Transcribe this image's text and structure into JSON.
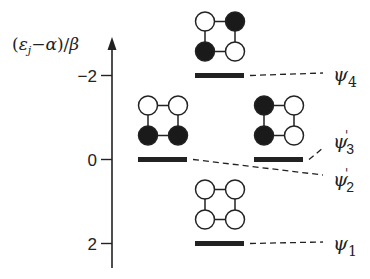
{
  "diagram": {
    "type": "huckel-mo-energy-diagram",
    "axis": {
      "label_parts": {
        "open": "(",
        "epsilon": "ε",
        "subscript": "j",
        "minus": "−",
        "alpha": "α",
        "close": ")/",
        "beta": "β"
      },
      "ticks": [
        {
          "value": -2,
          "label": "−2"
        },
        {
          "value": 0,
          "label": "0"
        },
        {
          "value": 2,
          "label": "2"
        }
      ],
      "range": [
        3,
        -3
      ]
    },
    "levels": [
      {
        "id": "psi4",
        "energy": -2,
        "column": "center",
        "label_base": "ψ",
        "label_sub": "4",
        "label_prime": "",
        "atoms_filled": {
          "tl": false,
          "tr": true,
          "bl": true,
          "br": false
        }
      },
      {
        "id": "psi2p",
        "energy": 0,
        "column": "left",
        "label_base": "ψ",
        "label_sub": "2",
        "label_prime": "'",
        "atoms_filled": {
          "tl": false,
          "tr": false,
          "bl": true,
          "br": true
        }
      },
      {
        "id": "psi3p",
        "energy": 0,
        "column": "right",
        "label_base": "ψ",
        "label_sub": "3",
        "label_prime": "'",
        "atoms_filled": {
          "tl": true,
          "tr": false,
          "bl": true,
          "br": false
        }
      },
      {
        "id": "psi1",
        "energy": 2,
        "column": "center",
        "label_base": "ψ",
        "label_sub": "1",
        "label_prime": "",
        "atoms_filled": {
          "tl": false,
          "tr": false,
          "bl": false,
          "br": false
        }
      }
    ],
    "colors": {
      "ink": "#222222",
      "filled_atom": "#1a1a1a",
      "empty_atom": "#ffffff"
    }
  }
}
